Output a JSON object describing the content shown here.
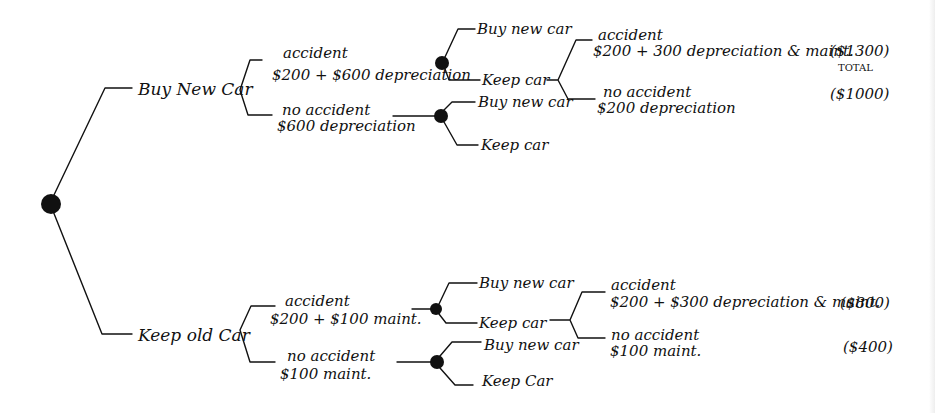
{
  "diagram": {
    "type": "decision-tree",
    "root": {
      "options": [
        {
          "label": "Buy New Car",
          "outcomes": [
            {
              "label": "accident",
              "cost": "$200 + $600 depreciation",
              "next": {
                "choices": [
                  {
                    "label": "Buy new car"
                  },
                  {
                    "label": "Keep car",
                    "outcomes": [
                      {
                        "label": "accident",
                        "cost": "$200 + 300 depreciation & maint.",
                        "total": "($1300)",
                        "total_note": "TOTAL"
                      },
                      {
                        "label": "no accident",
                        "cost": "$200 depreciation",
                        "total": "($1000)"
                      }
                    ]
                  }
                ]
              }
            },
            {
              "label": "no accident",
              "cost": "$600 depreciation",
              "next": {
                "choices": [
                  {
                    "label": "Buy new car"
                  },
                  {
                    "label": "Keep car"
                  }
                ]
              }
            }
          ]
        },
        {
          "label": "Keep old Car",
          "outcomes": [
            {
              "label": "accident",
              "cost": "$200 + $100 maint.",
              "next": {
                "choices": [
                  {
                    "label": "Buy new car"
                  },
                  {
                    "label": "Keep car",
                    "outcomes": [
                      {
                        "label": "accident",
                        "cost": "$200 + $300 depreciation & maint.",
                        "total": "($800)"
                      },
                      {
                        "label": "no accident",
                        "cost": "$100 maint.",
                        "total": "($400)"
                      }
                    ]
                  }
                ]
              }
            },
            {
              "label": "no accident",
              "cost": "$100 maint.",
              "next": {
                "choices": [
                  {
                    "label": "Buy new car"
                  },
                  {
                    "label": "Keep Car"
                  }
                ]
              }
            }
          ]
        }
      ]
    }
  },
  "labels": {
    "buy_new_car": "Buy New Car",
    "keep_old_car": "Keep old Car",
    "top_acc": "accident",
    "top_acc_cost": "$200 + $600 depreciation",
    "top_noacc": "no accident",
    "top_noacc_cost": "$600 depreciation",
    "top_acc_buy": "Buy new car",
    "top_acc_keep": "Keep car",
    "top_noacc_buy": "Buy new car",
    "top_noacc_keep": "Keep car",
    "top_keep_acc": "accident",
    "top_keep_acc_cost": "$200 + 300 depreciation & maint.",
    "top_keep_acc_total": "($1300)",
    "top_total_note": "TOTAL",
    "top_keep_noacc": "no accident",
    "top_keep_noacc_cost": "$200 depreciation",
    "top_keep_noacc_total": "($1000)",
    "bot_acc": "accident",
    "bot_acc_cost": "$200 + $100 maint.",
    "bot_noacc": "no accident",
    "bot_noacc_cost": "$100 maint.",
    "bot_acc_buy": "Buy new car",
    "bot_acc_keep": "Keep car",
    "bot_noacc_buy": "Buy new car",
    "bot_noacc_keep": "Keep Car",
    "bot_keep_acc": "accident",
    "bot_keep_acc_cost": "$200 + $300 depreciation & maint.",
    "bot_keep_acc_total": "($800)",
    "bot_keep_noacc": "no accident",
    "bot_keep_noacc_cost": "$100 maint.",
    "bot_keep_noacc_total": "($400)"
  },
  "colors": {
    "ink": "#111111",
    "paper": "#ffffff"
  }
}
